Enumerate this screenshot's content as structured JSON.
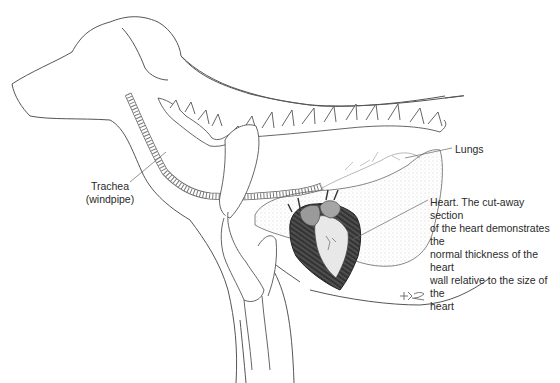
{
  "diagram": {
    "labels": {
      "trachea": {
        "line1": "Trachea",
        "line2": "(windpipe)"
      },
      "lungs": {
        "text": "Lungs"
      },
      "heart": {
        "lines": [
          "Heart. The cut-away section",
          "of the heart demonstrates the",
          "normal thickness of the heart",
          "wall relative to the size of the",
          "heart"
        ]
      }
    },
    "signature": "KG",
    "colors": {
      "line": "#555555",
      "heart_dark": "#2b2b2b",
      "heart_mid": "#9a9a9a",
      "lung_stipple": "#b8b8b8",
      "background": "#ffffff"
    }
  }
}
